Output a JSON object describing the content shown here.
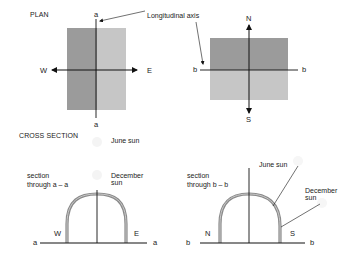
{
  "plan": {
    "title": "PLAN",
    "longitudinal_axis_label": "Longitudinal axis",
    "left": {
      "axis_top": "a",
      "axis_bottom": "a",
      "west": "W",
      "east": "E"
    },
    "right": {
      "axis_left": "b",
      "axis_right": "b",
      "north": "N",
      "south": "S"
    }
  },
  "cross_section": {
    "title": "CROSS SECTION",
    "left": {
      "section_label_line1": "section",
      "section_label_line2": "through a – a",
      "june_sun": "June sun",
      "december_sun_line1": "December",
      "december_sun_line2": "sun",
      "west": "W",
      "east": "E",
      "base_left": "a",
      "base_right": "a"
    },
    "right": {
      "section_label_line1": "section",
      "section_label_line2": "through b – b",
      "june_sun": "June sun",
      "december_sun_line1": "December",
      "december_sun_line2": "sun",
      "north": "N",
      "south": "S",
      "base_left": "b",
      "base_right": "b"
    }
  },
  "colors": {
    "dark_fill": "#9b9b9b",
    "light_fill": "#c6c6c6",
    "line": "#111111",
    "arc": "#8a8a8a"
  }
}
